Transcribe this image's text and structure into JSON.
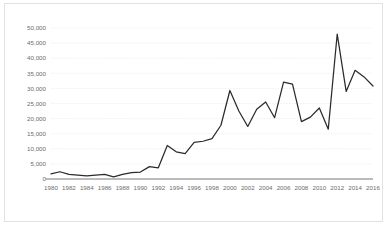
{
  "chart_data": {
    "type": "line",
    "title": "",
    "xlabel": "",
    "ylabel": "",
    "grid": true,
    "legend": false,
    "xlim": [
      1980,
      2016
    ],
    "ylim": [
      0,
      50000
    ],
    "ytick_labels": [
      "50,000",
      "45,000",
      "40,000",
      "35,000",
      "30,000",
      "25,000",
      "20,000",
      "15,000",
      "10,000",
      "5,000",
      "0"
    ],
    "ytick_values": [
      50000,
      45000,
      40000,
      35000,
      30000,
      25000,
      20000,
      15000,
      10000,
      5000,
      0
    ],
    "xtick_labels": [
      "1980",
      "1982",
      "1984",
      "1986",
      "1988",
      "1990",
      "1992",
      "1994",
      "1996",
      "1998",
      "2000",
      "2002",
      "2004",
      "2006",
      "2008",
      "2010",
      "2012",
      "2014",
      "2016"
    ],
    "xtick_values": [
      1980,
      1982,
      1984,
      1986,
      1988,
      1990,
      1992,
      1994,
      1996,
      1998,
      2000,
      2002,
      2004,
      2006,
      2008,
      2010,
      2012,
      2014,
      2016
    ],
    "x": [
      1980,
      1981,
      1982,
      1983,
      1984,
      1985,
      1986,
      1987,
      1988,
      1989,
      1990,
      1991,
      1992,
      1993,
      1994,
      1995,
      1996,
      1997,
      1998,
      1999,
      2000,
      2001,
      2002,
      2003,
      2004,
      2005,
      2006,
      2007,
      2008,
      2009,
      2010,
      2011,
      2012,
      2013,
      2014,
      2015,
      2016
    ],
    "values": [
      1700,
      2400,
      1500,
      1300,
      1000,
      1300,
      1500,
      700,
      1500,
      2100,
      2300,
      4100,
      3700,
      11100,
      9000,
      8400,
      12100,
      12500,
      13400,
      17800,
      29300,
      22500,
      17400,
      23100,
      25500,
      20300,
      32100,
      31400,
      19000,
      20500,
      23500,
      16500,
      48000,
      29000,
      36000,
      33800,
      30800
    ],
    "series_name": "series-1",
    "line_color": "#2b2b2b",
    "grid_color": "#e8e8e8",
    "axis_color": "#a6a6a6",
    "tick_text_color": "#6d6d6d",
    "frame_border_color": "#e2e2e2",
    "background_color": "#ffffff"
  }
}
